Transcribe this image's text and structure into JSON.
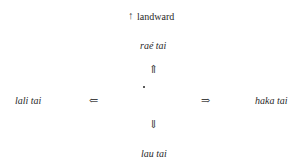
{
  "title": {
    "arrow": "↑",
    "label": "landward"
  },
  "directions": {
    "up": {
      "label": "raé tai",
      "arrow": "⇑"
    },
    "left": {
      "label": "lali tai",
      "arrow": "⇐"
    },
    "right": {
      "label": "haka tai",
      "arrow": "⇒"
    },
    "down": {
      "label": "lau tai",
      "arrow": "⇓"
    }
  },
  "center": {
    "symbol": "·"
  }
}
